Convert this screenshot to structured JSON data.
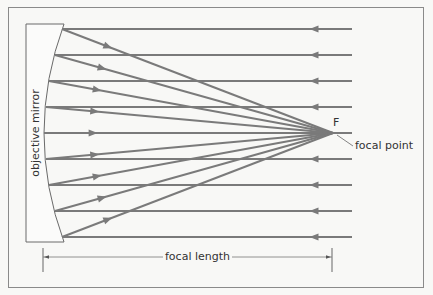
{
  "diagram": {
    "labels": {
      "mirror": "objective mirror",
      "focal_point_marker": "F",
      "focal_point": "focal point",
      "focal_length": "focal length"
    },
    "colors": {
      "background": "#f8f8f6",
      "frame": "#8a8a8a",
      "ray": "#7a7a7a",
      "mirror_outline": "#6a6a6a",
      "text": "#333333"
    },
    "frame": {
      "x": 8,
      "y": 7,
      "width": 415,
      "height": 280
    },
    "mirror": {
      "left_x": 26,
      "top_y": 24,
      "bottom_y": 242,
      "edge_x": 64,
      "center_x": 44,
      "center_y": 133
    },
    "focus": {
      "x": 333,
      "y": 133
    },
    "ray_end_x": 352,
    "incoming_arrow_x": 314,
    "rays": [
      {
        "y": 29,
        "mirror_x": 62
      },
      {
        "y": 55,
        "mirror_x": 55
      },
      {
        "y": 81,
        "mirror_x": 49
      },
      {
        "y": 107,
        "mirror_x": 46
      },
      {
        "y": 133,
        "mirror_x": 44
      },
      {
        "y": 159,
        "mirror_x": 46
      },
      {
        "y": 185,
        "mirror_x": 49
      },
      {
        "y": 211,
        "mirror_x": 55
      },
      {
        "y": 237,
        "mirror_x": 62
      }
    ],
    "dimension": {
      "y": 257,
      "x1": 43,
      "x2": 332,
      "tick_top": 248,
      "tick_bottom": 272
    },
    "leader": {
      "x1": 337,
      "y1": 135,
      "x2": 353,
      "y2": 146
    }
  }
}
